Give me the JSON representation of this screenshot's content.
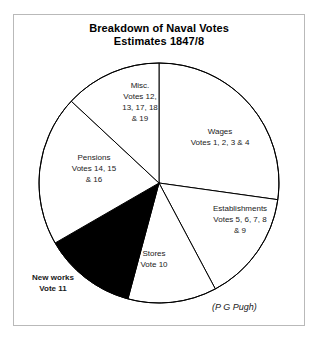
{
  "figure": {
    "title_line1": "Breakdown of Naval Votes",
    "title_line2": "Estimates 1847/8",
    "credit": "(P G Pugh)"
  },
  "labels": {
    "wages": {
      "line1": "Wages",
      "line2": "Votes 1, 2, 3 & 4",
      "line3": "",
      "line4": ""
    },
    "establishments": {
      "line1": "Establishments",
      "line2": "Votes 5, 6, 7, 8",
      "line3": "& 9",
      "line4": ""
    },
    "stores": {
      "line1": "Stores",
      "line2": "Vote 10",
      "line3": "",
      "line4": ""
    },
    "newworks": {
      "line1": "New works",
      "line2": "Vote 11",
      "line3": "",
      "line4": ""
    },
    "pensions": {
      "line1": "Pensions",
      "line2": "Votes 14, 15",
      "line3": "& 16",
      "line4": ""
    },
    "misc": {
      "line1": "Misc.",
      "line2": "Votes 12,",
      "line3": "13, 17, 18",
      "line4": "& 19"
    }
  },
  "chart_data": {
    "type": "pie",
    "title": "Breakdown of Naval Votes Estimates 1847/8",
    "subtitle": "Estimates 1847/8",
    "annotation": "(P G Pugh)",
    "units": "percent of total naval estimate",
    "start_angle_deg": 0,
    "direction": "clockwise",
    "center": {
      "x": 159,
      "y": 183
    },
    "radius": 120,
    "categories": [
      "Wages",
      "Establishments",
      "Stores",
      "New works",
      "Pensions",
      "Misc."
    ],
    "values": [
      27.2,
      15.0,
      12.0,
      12.5,
      20.3,
      13.0
    ],
    "slices": [
      {
        "name": "Wages",
        "votes": "Votes 1, 2, 3 & 4",
        "value": 27.2,
        "start_deg": 0,
        "end_deg": 98,
        "fill": "#ffffff",
        "stroke": "#000000"
      },
      {
        "name": "Establishments",
        "votes": "Votes 5, 6, 7, 8 & 9",
        "value": 15.0,
        "start_deg": 98,
        "end_deg": 152,
        "fill": "#ffffff",
        "stroke": "#000000"
      },
      {
        "name": "Stores",
        "votes": "Vote 10",
        "value": 12.0,
        "start_deg": 152,
        "end_deg": 195,
        "fill": "#ffffff",
        "stroke": "#000000"
      },
      {
        "name": "New works",
        "votes": "Vote 11",
        "value": 12.5,
        "start_deg": 195,
        "end_deg": 240,
        "fill": "#000000",
        "stroke": "#000000"
      },
      {
        "name": "Pensions",
        "votes": "Votes 14, 15 & 16",
        "value": 20.3,
        "start_deg": 240,
        "end_deg": 313,
        "fill": "#ffffff",
        "stroke": "#000000"
      },
      {
        "name": "Misc.",
        "votes": "Votes 12, 13, 17, 18 & 19",
        "value": 13.0,
        "start_deg": 313,
        "end_deg": 360,
        "fill": "#ffffff",
        "stroke": "#000000"
      }
    ],
    "legend": "inline-labels",
    "grid": false
  }
}
